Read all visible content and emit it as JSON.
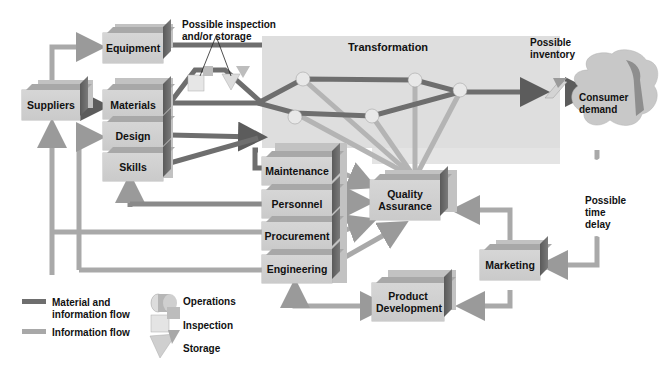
{
  "diagram": {
    "type": "operations-flow",
    "panel": {
      "title": "Transformation"
    },
    "boxes": {
      "suppliers": "Suppliers",
      "equipment": "Equipment",
      "materials": "Materials",
      "design": "Design",
      "skills": "Skills",
      "maintenance": "Maintenance",
      "personnel": "Personnel",
      "procurement": "Procurement",
      "engineering": "Engineering",
      "quality_assurance": "Quality Assurance",
      "product_development": "Product Development",
      "marketing": "Marketing",
      "consumer_demand": "Consumer demand"
    },
    "annotations": {
      "inspection_storage_line1": "Possible inspection",
      "inspection_storage_line2": "and/or storage",
      "inventory_line1": "Possible",
      "inventory_line2": "inventory",
      "time_delay_line1": "Possible",
      "time_delay_line2": "time",
      "time_delay_line3": "delay"
    },
    "legend": {
      "material_flow_line1": "Material and",
      "material_flow_line2": "information flow",
      "information_flow": "Information flow",
      "operations": "Operations",
      "inspection": "Inspection",
      "storage": "Storage"
    },
    "colors": {
      "material_flow": "#6e6e6e",
      "information_flow": "#a8a8a8",
      "box_face": "#d0d0d0",
      "box_side": "#666666",
      "panel": "#dedede"
    }
  }
}
